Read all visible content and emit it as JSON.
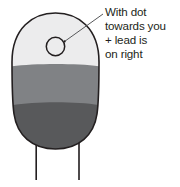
{
  "diagram": {
    "callout": {
      "lines": [
        "With dot",
        "towards you",
        "+ lead is",
        "on right"
      ],
      "text_color": "#231f20"
    },
    "component": {
      "name": "capsule-body",
      "outline_color": "#231f20",
      "bands": [
        {
          "name": "top-band",
          "color": "#ececed"
        },
        {
          "name": "middle-band",
          "color": "#808285"
        },
        {
          "name": "bottom-band",
          "color": "#58595b"
        }
      ],
      "marker": {
        "name": "polarity-dot",
        "fill": "#ececed",
        "stroke": "#231f20"
      },
      "leads": [
        {
          "name": "lead-left",
          "color": "#231f20"
        },
        {
          "name": "lead-right",
          "color": "#231f20"
        }
      ],
      "leader_line_color": "#58595b"
    }
  }
}
